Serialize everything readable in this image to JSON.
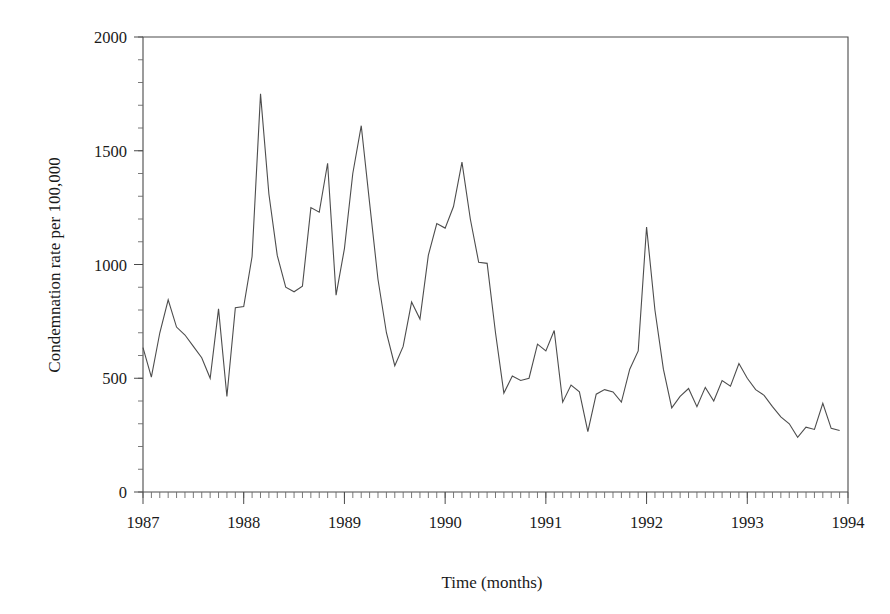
{
  "chart_data": {
    "type": "line",
    "title": "",
    "subtitle": "",
    "xlabel": "Time (months)",
    "ylabel": "Condemnation rate per 100,000",
    "xlim": [
      1987.0,
      1994.0
    ],
    "ylim": [
      0,
      2000
    ],
    "y_ticks": [
      0,
      500,
      1000,
      1500,
      2000
    ],
    "y_tick_labels": [
      "0",
      "500",
      "1000",
      "1500",
      "2000"
    ],
    "y_minor_tick_step": 100,
    "x_ticks": [
      1987,
      1988,
      1989,
      1990,
      1991,
      1992,
      1993,
      1994
    ],
    "x_tick_labels": [
      "1987",
      "1988",
      "1989",
      "1990",
      "1991",
      "1992",
      "1993",
      "1994"
    ],
    "x_minor_tick_step": 0.0833333,
    "grid": false,
    "legend": false,
    "legend_position": "none",
    "series": [
      {
        "name": "Condemnation rate",
        "color": "#4d4d4d",
        "x": [
          1987.0,
          1987.083,
          1987.167,
          1987.25,
          1987.333,
          1987.417,
          1987.5,
          1987.583,
          1987.667,
          1987.75,
          1987.833,
          1987.917,
          1988.0,
          1988.083,
          1988.167,
          1988.25,
          1988.333,
          1988.417,
          1988.5,
          1988.583,
          1988.667,
          1988.75,
          1988.833,
          1988.917,
          1989.0,
          1989.083,
          1989.167,
          1989.25,
          1989.333,
          1989.417,
          1989.5,
          1989.583,
          1989.667,
          1989.75,
          1989.833,
          1989.917,
          1990.0,
          1990.083,
          1990.167,
          1990.25,
          1990.333,
          1990.417,
          1990.5,
          1990.583,
          1990.667,
          1990.75,
          1990.833,
          1990.917,
          1991.0,
          1991.083,
          1991.167,
          1991.25,
          1991.333,
          1991.417,
          1991.5,
          1991.583,
          1991.667,
          1991.75,
          1991.833,
          1991.917,
          1992.0,
          1992.083,
          1992.167,
          1992.25,
          1992.333,
          1992.417,
          1992.5,
          1992.583,
          1992.667,
          1992.75,
          1992.833,
          1992.917,
          1993.0,
          1993.083,
          1993.167,
          1993.25,
          1993.333,
          1993.417,
          1993.5,
          1993.583,
          1993.667,
          1993.75,
          1993.833,
          1993.917
        ],
        "values": [
          635,
          505,
          700,
          845,
          725,
          690,
          640,
          590,
          500,
          805,
          420,
          810,
          815,
          1035,
          1750,
          1310,
          1040,
          900,
          880,
          905,
          1250,
          1230,
          1445,
          865,
          1070,
          1400,
          1610,
          1270,
          935,
          700,
          555,
          640,
          835,
          760,
          1040,
          1180,
          1160,
          1255,
          1450,
          1200,
          1010,
          1005,
          700,
          435,
          510,
          490,
          500,
          650,
          620,
          710,
          395,
          470,
          440,
          265,
          430,
          450,
          440,
          395,
          540,
          620,
          1165,
          800,
          540,
          370,
          420,
          455,
          375,
          460,
          400,
          490,
          465,
          565,
          500,
          450,
          425,
          375,
          330,
          300,
          240,
          285,
          275,
          390,
          280,
          270
        ]
      }
    ]
  },
  "axes": {
    "y_title": "Condemnation rate per 100,000",
    "x_title": "Time (months)"
  },
  "colors": {
    "line": "#4d4d4d",
    "frame": "#4a4a4a",
    "text": "#1a1a1a",
    "background": "#ffffff"
  }
}
